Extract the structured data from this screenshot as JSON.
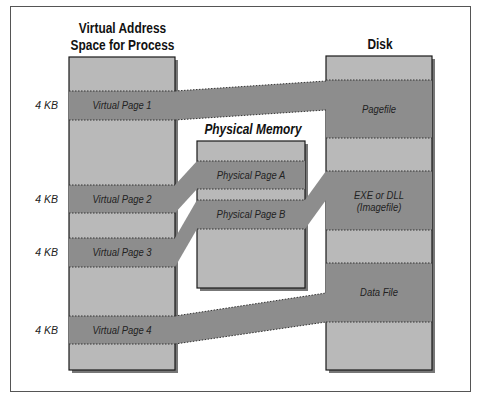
{
  "colors": {
    "light_fill": "#b9b9b9",
    "dark_band": "#8d8d8d",
    "border": "#1a1a1a",
    "shadow": "#7a7a7a"
  },
  "virtual": {
    "title": "Virtual Address Space for Process",
    "title_line1": "Virtual Address",
    "title_line2": "Space for Process",
    "pages": [
      {
        "label": "Virtual Page 1",
        "size": "4 KB"
      },
      {
        "label": "Virtual Page 2",
        "size": "4 KB"
      },
      {
        "label": "Virtual Page 3",
        "size": "4 KB"
      },
      {
        "label": "Virtual Page 4",
        "size": "4 KB"
      }
    ]
  },
  "physical": {
    "title": "Physical Memory",
    "pages": [
      {
        "label": "Physical Page A"
      },
      {
        "label": "Physical Page B"
      }
    ]
  },
  "disk": {
    "title": "Disk",
    "regions": [
      {
        "label": "Pagefile"
      },
      {
        "label_line1": "EXE or DLL",
        "label_line2": "(Imagefile)"
      },
      {
        "label": "Data File"
      }
    ]
  },
  "mappings": [
    {
      "from": "Virtual Page 1",
      "to": "Pagefile"
    },
    {
      "from": "Virtual Page 2",
      "to": "Physical Page A"
    },
    {
      "from": "Virtual Page 3",
      "to": "Physical Page B"
    },
    {
      "from": "Physical Page B",
      "to": "EXE or DLL (Imagefile)"
    },
    {
      "from": "Virtual Page 4",
      "to": "Data File"
    }
  ]
}
